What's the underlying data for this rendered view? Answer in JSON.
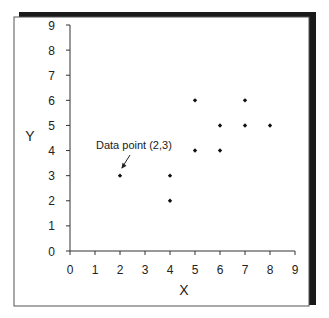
{
  "chart_data": {
    "type": "scatter",
    "title": "",
    "xlabel": "X",
    "ylabel": "Y",
    "xlim": [
      0,
      9
    ],
    "ylim": [
      0,
      9
    ],
    "xticks": [
      0,
      1,
      2,
      3,
      4,
      5,
      6,
      7,
      8,
      9
    ],
    "yticks": [
      0,
      1,
      2,
      3,
      4,
      5,
      6,
      7,
      8,
      9
    ],
    "grid": false,
    "legend": null,
    "series": [
      {
        "name": "data",
        "points": [
          {
            "x": 2,
            "y": 3
          },
          {
            "x": 4,
            "y": 3
          },
          {
            "x": 4,
            "y": 2
          },
          {
            "x": 5,
            "y": 6
          },
          {
            "x": 5,
            "y": 4
          },
          {
            "x": 6,
            "y": 5
          },
          {
            "x": 6,
            "y": 4
          },
          {
            "x": 7,
            "y": 6
          },
          {
            "x": 7,
            "y": 5
          },
          {
            "x": 8,
            "y": 5
          }
        ]
      }
    ],
    "annotations": [
      {
        "text": "Data point (2,3)",
        "target": {
          "x": 2,
          "y": 3
        },
        "arrow": true
      }
    ]
  },
  "colors": {
    "frame_shadow": "#1a1a1a",
    "axis": "#333333",
    "marker": "#111111"
  }
}
